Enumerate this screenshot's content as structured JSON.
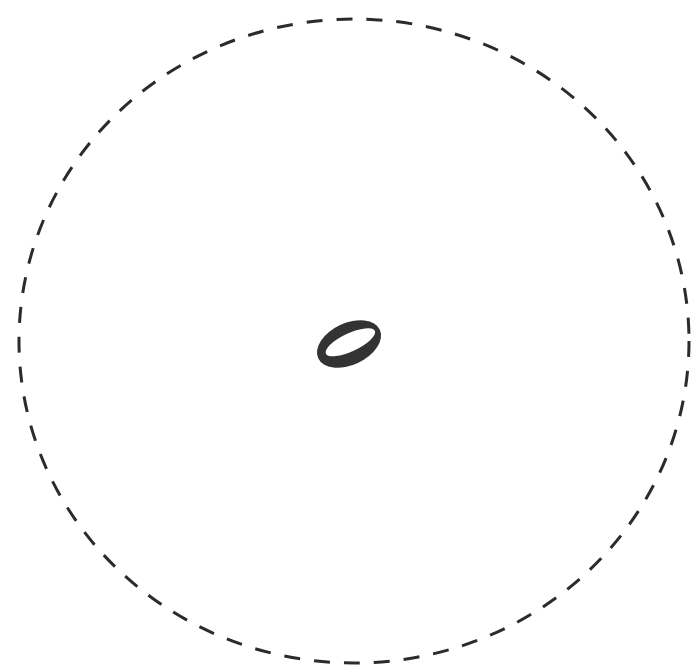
{
  "diagram": {
    "boundary": {
      "shape": "dashed-ellipse",
      "cx": 354,
      "cy": 341,
      "rx": 335,
      "ry": 322,
      "stroke": "#2b2b2b",
      "dash": "16 14",
      "stroke_width": 3
    },
    "center_object": {
      "shape": "tilted-ring",
      "cx": 349,
      "cy": 344,
      "outer_rx": 34,
      "outer_ry": 21,
      "inner_rx": 27,
      "inner_ry": 9,
      "rotation_deg": -25,
      "fill": "#333333"
    }
  }
}
